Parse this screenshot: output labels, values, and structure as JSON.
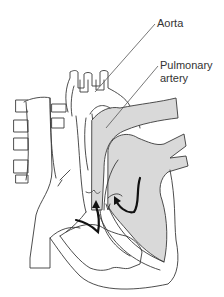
{
  "diagram": {
    "labels": [
      {
        "text": "Aorta",
        "x": 157,
        "y": 17
      },
      {
        "text": "Pulmonary",
        "x": 160,
        "y": 59
      },
      {
        "text": "artery",
        "x": 160,
        "y": 72
      }
    ],
    "colors": {
      "stroke": "#3a3a3a",
      "fill_shaded": "#d9d9d9",
      "fill_white": "#ffffff",
      "arrow": "#111111",
      "leader": "#555555"
    }
  }
}
